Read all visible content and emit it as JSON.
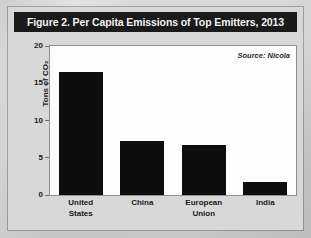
{
  "figure": {
    "title": "Figure 2. Per Capita Emissions of Top Emitters, 2013",
    "source_note": "Source: Nicola"
  },
  "chart_data": {
    "type": "bar",
    "title": "Figure 2. Per Capita Emissions of Top Emitters, 2013",
    "xlabel": "",
    "ylabel": "Tons of CO₂",
    "categories": [
      "United States",
      "China",
      "European Union",
      "India"
    ],
    "category_lines": [
      [
        "United",
        "States"
      ],
      [
        "China"
      ],
      [
        "European",
        "Union"
      ],
      [
        "India"
      ]
    ],
    "values": [
      16.5,
      7.2,
      6.7,
      1.7
    ],
    "ylim": [
      0,
      20
    ],
    "yticks": [
      0,
      5,
      10,
      15,
      20
    ],
    "ytick_labels": [
      "0",
      "5",
      "10",
      "15",
      "20"
    ],
    "grid": false,
    "legend": "none",
    "annotations": [
      "Source: Nicola"
    ],
    "bar_color": "#0d0d0d",
    "plot_background": "#fdfdfd",
    "title_background": "#1a1a1a",
    "title_color": "#f2f2f2"
  }
}
